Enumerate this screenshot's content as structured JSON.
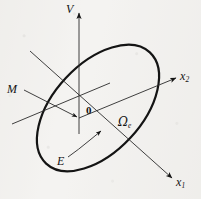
{
  "figure": {
    "background_color": "#f4f3f1",
    "ink_color": "#141414"
  },
  "axes": [
    {
      "id": "vertical-axis",
      "label": "V",
      "description": "vertical axis pointing up with arrowhead",
      "from": [
        79,
        121
      ],
      "to": [
        79,
        12
      ],
      "arrow": true
    },
    {
      "id": "x2-axis",
      "label": "x",
      "subscript": "2",
      "description": "axis to the upper right with arrowhead",
      "from": [
        79,
        118
      ],
      "to": [
        178,
        77
      ],
      "arrow": true
    },
    {
      "id": "x1-axis",
      "label": "x",
      "subscript": "1",
      "description": "axis to the lower right with arrowhead",
      "from": [
        30,
        51
      ],
      "to": [
        174,
        180
      ],
      "arrow": true
    }
  ],
  "labels": {
    "vertical": "V",
    "x2": "x",
    "x2_sub": "2",
    "x1": "x",
    "x1_sub": "1",
    "node_line": "M",
    "origin": "0",
    "angle_omega": "Ω",
    "angle_omega_sub": "e",
    "angle_E": "E"
  },
  "shapes": {
    "ellipse": {
      "name": "orbital-ellipse",
      "center": [
        98,
        108
      ],
      "radius_x": 76,
      "radius_y": 44,
      "rotation_deg": -47,
      "stroke_width": 2.2
    },
    "node_line": {
      "name": "node-line-M",
      "description": "thin line from label M to the origin terminating in an arrowhead",
      "from": [
        27,
        91
      ],
      "to": [
        78,
        118
      ]
    },
    "chord_line": {
      "name": "ellipse-chord",
      "description": "thin line crossing the ellipse through the node direction",
      "from": [
        12,
        124
      ],
      "to": [
        108,
        84
      ]
    },
    "angle_arc_E": {
      "name": "angle-arc-E",
      "description": "arc from near label E sweeping up to the x1 axis with an arrowhead",
      "start": [
        70,
        158
      ],
      "end": [
        103,
        134
      ]
    }
  },
  "annotations": [
    {
      "name": "label-V",
      "text": "V",
      "x": 66,
      "y": 3
    },
    {
      "name": "label-x2",
      "text": "x2",
      "x": 180,
      "y": 70
    },
    {
      "name": "label-x1",
      "text": "x1",
      "x": 176,
      "y": 176
    },
    {
      "name": "label-M",
      "text": "M",
      "x": 7,
      "y": 83
    },
    {
      "name": "label-origin",
      "text": "0",
      "x": 86,
      "y": 105
    },
    {
      "name": "label-omega",
      "text": "Ωe",
      "x": 118,
      "y": 116
    },
    {
      "name": "label-E",
      "text": "E",
      "x": 57,
      "y": 155
    }
  ]
}
